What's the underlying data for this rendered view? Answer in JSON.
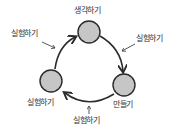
{
  "diagram": {
    "type": "cycle",
    "colors": {
      "node_fill": "#c6c6c6",
      "stroke": "#2b2b2b",
      "text": "#333333"
    },
    "nodes": [
      {
        "id": "think",
        "label": "생각하기",
        "cx": 89,
        "cy": 32,
        "r": 11
      },
      {
        "id": "make",
        "label": "만들기",
        "cx": 124,
        "cy": 85,
        "r": 11
      },
      {
        "id": "experiment",
        "label": "실험하기",
        "cx": 51,
        "cy": 81,
        "r": 11
      }
    ],
    "edges": [
      {
        "from": "think",
        "to": "make"
      },
      {
        "from": "make",
        "to": "experiment"
      },
      {
        "from": "experiment",
        "to": "think"
      }
    ],
    "annotations": [
      {
        "label": "실험하기",
        "target": "edge-think-make"
      },
      {
        "label": "실험하기",
        "target": "edge-make-experiment"
      },
      {
        "label": "실험하기",
        "target": "edge-experiment-think"
      }
    ]
  }
}
